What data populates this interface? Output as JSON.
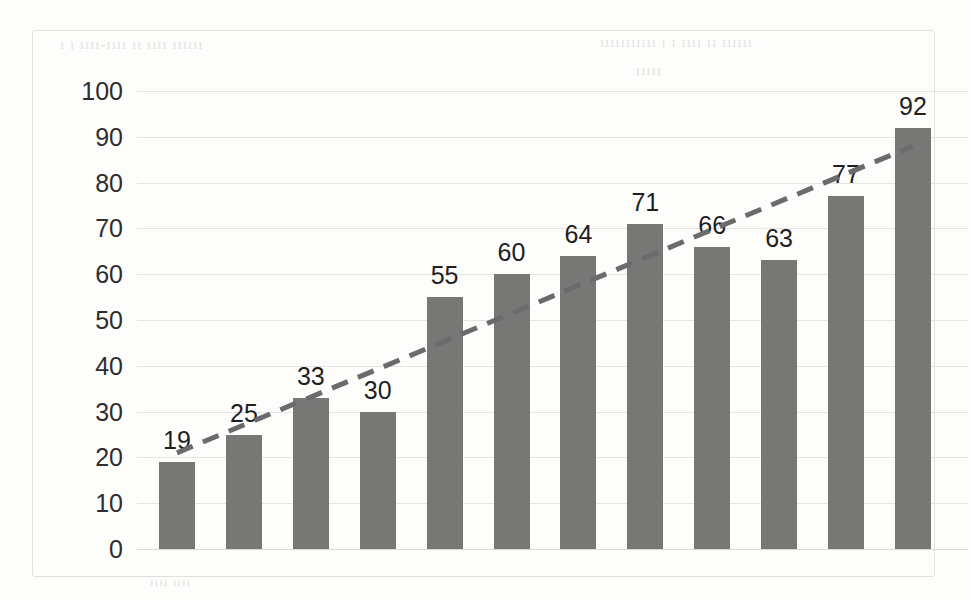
{
  "chart_data": {
    "type": "bar",
    "title": "",
    "subtitle": "",
    "xlabel": "",
    "ylabel": "",
    "categories": [
      "2008",
      "2009",
      "2010",
      "2011",
      "2012",
      "2013",
      "2014",
      "2015",
      "2016",
      "2017",
      "2018",
      "2019"
    ],
    "values": [
      19,
      25,
      33,
      30,
      55,
      60,
      64,
      71,
      66,
      63,
      77,
      92
    ],
    "data_labels": [
      "19",
      "25",
      "33",
      "30",
      "55",
      "60",
      "64",
      "71",
      "66",
      "63",
      "77",
      "92"
    ],
    "ylim": [
      0,
      100
    ],
    "ytick_labels": [
      "100",
      "90",
      "80",
      "70",
      "60",
      "50",
      "40",
      "30",
      "20",
      "10",
      "0"
    ],
    "ytick_values": [
      100,
      90,
      80,
      70,
      60,
      50,
      40,
      30,
      20,
      10,
      0
    ],
    "grid": true,
    "legend": "none",
    "series": [
      {
        "name": "bars",
        "type": "bar",
        "values": [
          19,
          25,
          33,
          30,
          55,
          60,
          64,
          71,
          66,
          63,
          77,
          92
        ]
      },
      {
        "name": "trendline",
        "type": "line",
        "style": "dashed",
        "start_value": 21,
        "end_value": 88
      }
    ],
    "colors": {
      "bar": "#777776",
      "trendline": "#6b6b6b",
      "gridline": "#e6e5e2",
      "text": "#1f1f1f",
      "frame": "#e2e1de",
      "background": "#fdfdfc"
    }
  },
  "bleedthrough": {
    "line1": "ı ı ıııı‐ıııı ıı ıııı ıııııı",
    "line2": "ııııııııııı ı ı ıııı ıı ıııııı",
    "line3": "ııııı",
    "line4": "ıııı ıııı"
  }
}
